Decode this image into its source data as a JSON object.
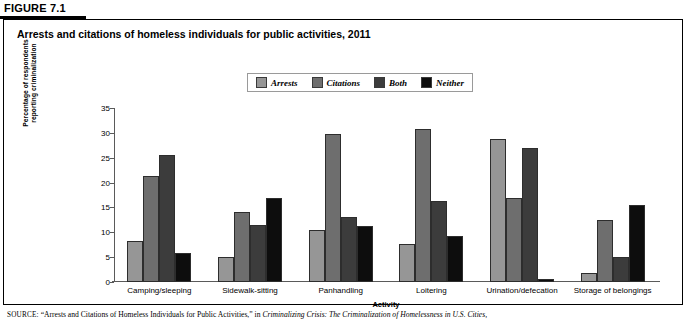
{
  "figure": {
    "label": "FIGURE 7.1",
    "title": "Arrests and citations of homeless individuals for public activities, 2011"
  },
  "source": {
    "prefix": "SOURCE:",
    "quoted": "“Arrests and Citations of Homeless Individuals for Public Activities,”",
    "connector": "in",
    "italic": "Criminalizing Crisis: The Criminalization of Homelessness in U.S. Cities,"
  },
  "colors": {
    "arrests": "#969696",
    "citations": "#6e6e6e",
    "both": "#3c3c3c",
    "neither": "#0d0d0d",
    "axis": "#5a5a5a",
    "frame": "#000000"
  },
  "chart_data": {
    "type": "bar",
    "title": "Arrests and citations of homeless individuals for public activities, 2011",
    "xlabel": "Activity",
    "ylabel": "Percentage of respondents reporting criminalization",
    "ylim": [
      0,
      35
    ],
    "yticks": [
      0,
      5,
      10,
      15,
      20,
      25,
      30,
      35
    ],
    "grid": false,
    "legend_position": "top-center",
    "categories": [
      "Camping/sleeping",
      "Sidewalk-sitting",
      "Panhandling",
      "Loitering",
      "Urination/defecation",
      "Storage of belongings"
    ],
    "series": [
      {
        "name": "Arrests",
        "color_key": "arrests",
        "values": [
          8.2,
          5.0,
          10.5,
          7.7,
          28.8,
          1.8
        ]
      },
      {
        "name": "Citations",
        "color_key": "citations",
        "values": [
          21.4,
          14.0,
          29.8,
          30.8,
          17.0,
          12.5
        ]
      },
      {
        "name": "Both",
        "color_key": "both",
        "values": [
          25.5,
          11.5,
          13.0,
          16.2,
          27.0,
          5.0
        ]
      },
      {
        "name": "Neither",
        "color_key": "neither",
        "values": [
          5.8,
          17.0,
          11.2,
          9.2,
          0.6,
          15.4
        ]
      }
    ]
  }
}
